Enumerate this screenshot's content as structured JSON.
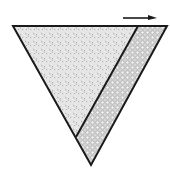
{
  "diagram": {
    "colors": {
      "stroke": "#1a1a1a",
      "fill_left": "#e4e4e4",
      "fill_right": "#dcdcdc",
      "speckle": "#9a9a9a",
      "cobble": "#8f8f8f",
      "background": "#ffffff"
    },
    "arrow": {
      "direction": "right"
    },
    "regions": [
      {
        "name": "left-region",
        "texture": "speckled"
      },
      {
        "name": "right-strip",
        "texture": "cobbled"
      }
    ]
  }
}
